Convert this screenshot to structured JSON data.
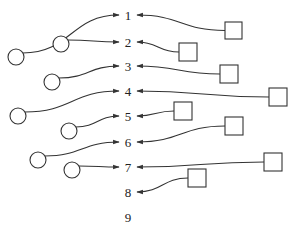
{
  "diagram": {
    "type": "matching",
    "slots": [
      {
        "label": "1",
        "x": 128,
        "y": 15
      },
      {
        "label": "2",
        "x": 128,
        "y": 42
      },
      {
        "label": "3",
        "x": 128,
        "y": 66
      },
      {
        "label": "4",
        "x": 128,
        "y": 91
      },
      {
        "label": "5",
        "x": 128,
        "y": 116
      },
      {
        "label": "6",
        "x": 128,
        "y": 142
      },
      {
        "label": "7",
        "x": 128,
        "y": 167
      },
      {
        "label": "8",
        "x": 128,
        "y": 192
      },
      {
        "label": "9",
        "x": 128,
        "y": 217
      }
    ],
    "circles": [
      {
        "cx": 16,
        "cy": 57,
        "r": 8,
        "target": "1"
      },
      {
        "cx": 61,
        "cy": 44,
        "r": 8,
        "target": "2"
      },
      {
        "cx": 52,
        "cy": 82,
        "r": 8,
        "target": "3"
      },
      {
        "cx": 18,
        "cy": 116,
        "r": 8,
        "target": "4"
      },
      {
        "cx": 69,
        "cy": 131,
        "r": 8,
        "target": "5"
      },
      {
        "cx": 38,
        "cy": 160,
        "r": 8,
        "target": "6"
      },
      {
        "cx": 72,
        "cy": 170,
        "r": 8,
        "target": "7"
      }
    ],
    "squares": [
      {
        "x": 225,
        "y": 22,
        "size": 17,
        "target": "1"
      },
      {
        "x": 179,
        "y": 43,
        "size": 18,
        "target": "2"
      },
      {
        "x": 220,
        "y": 65,
        "size": 18,
        "target": "3"
      },
      {
        "x": 269,
        "y": 88,
        "size": 18,
        "target": "4"
      },
      {
        "x": 174,
        "y": 102,
        "size": 18,
        "target": "5"
      },
      {
        "x": 225,
        "y": 117,
        "size": 18,
        "target": "6"
      },
      {
        "x": 264,
        "y": 153,
        "size": 18,
        "target": "7"
      },
      {
        "x": 188,
        "y": 169,
        "size": 18,
        "target": "8"
      }
    ],
    "colors": {
      "stroke": "#333333",
      "text": "#222222",
      "background": "#ffffff"
    }
  }
}
